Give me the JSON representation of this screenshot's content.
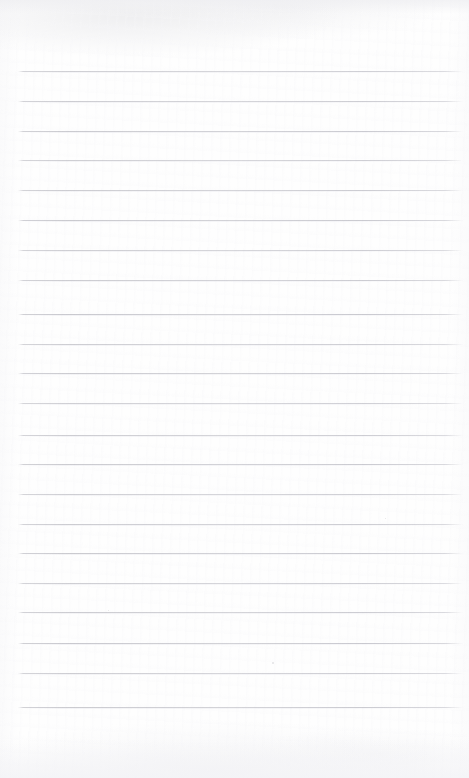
{
  "document": {
    "kind": "lined-paper",
    "title": "",
    "body_text": "",
    "page_width": 469,
    "page_height": 778,
    "background_color": "#fefefe",
    "rule_color": "#c4c4ca",
    "margin_top": 71,
    "margin_bottom": 71,
    "rule_left": 18,
    "rule_right": 463,
    "rule_spacing": 29.8,
    "rule_count": 22,
    "rule_positions": [
      71,
      101,
      131,
      160,
      190,
      220,
      250,
      280,
      314,
      344,
      373,
      403,
      435,
      464,
      494,
      524,
      553,
      583,
      612,
      643,
      673,
      707
    ],
    "written_lines": [
      "",
      "",
      "",
      "",
      "",
      "",
      "",
      "",
      "",
      "",
      "",
      "",
      "",
      "",
      "",
      "",
      "",
      "",
      "",
      "",
      "",
      ""
    ],
    "specks": [
      {
        "x": 272,
        "y": 662,
        "size": 2
      },
      {
        "x": 385,
        "y": 518,
        "size": 1
      },
      {
        "x": 108,
        "y": 610,
        "size": 1
      }
    ]
  }
}
